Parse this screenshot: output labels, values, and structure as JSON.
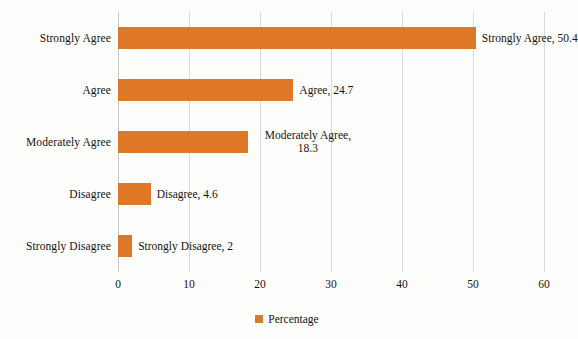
{
  "chart_data": {
    "type": "bar",
    "orientation": "horizontal",
    "title": "",
    "subtitle": "",
    "xlabel": "",
    "ylabel": "",
    "categories": [
      "Strongly Agree",
      "Agree",
      "Moderately Agree",
      "Disagree",
      "Strongly Disagree"
    ],
    "values": [
      50.4,
      24.7,
      18.3,
      4.6,
      2
    ],
    "series": [
      {
        "name": "Percentage",
        "values": [
          50.4,
          24.7,
          18.3,
          4.6,
          2
        ],
        "color": "#DF7826"
      }
    ],
    "data_labels": [
      "Strongly Agree, 50.4",
      "Agree, 24.7",
      "Moderately Agree, 18.3",
      "Disagree, 4.6",
      "Strongly Disagree, 2"
    ],
    "data_label_lines": [
      [
        "Strongly Agree, 50.4"
      ],
      [
        "Agree, 24.7"
      ],
      [
        "Moderately Agree,",
        "18.3"
      ],
      [
        "Disagree, 4.6"
      ],
      [
        "Strongly Disagree, 2"
      ]
    ],
    "xlim": [
      0,
      60
    ],
    "xticks": [
      0,
      10,
      20,
      30,
      40,
      50,
      60
    ],
    "xticklabels": [
      "0",
      "10",
      "20",
      "30",
      "40",
      "50",
      "60"
    ],
    "grid": "vertical",
    "legend": {
      "position": "bottom",
      "entries": [
        {
          "label": "Percentage",
          "color": "#DF7826",
          "marker": "square-swatch-icon"
        }
      ]
    },
    "colors": {
      "bar": "#DF7826",
      "gridline": "#d9d9d9",
      "text": "#141414",
      "background": "#fdfdfb"
    }
  }
}
